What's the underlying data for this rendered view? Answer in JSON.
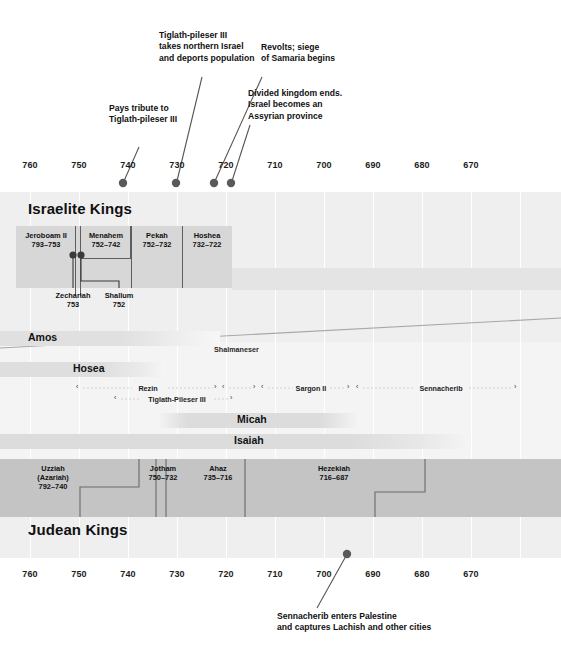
{
  "axis": {
    "ticks": [
      "760",
      "750",
      "740",
      "730",
      "720",
      "710",
      "700",
      "690",
      "680",
      "670"
    ],
    "tick_values": [
      760,
      750,
      740,
      730,
      720,
      710,
      700,
      690,
      680,
      670
    ],
    "direction": "BC descending left to right"
  },
  "sections": {
    "israelite_title": "Israelite Kings",
    "judean_title": "Judean Kings"
  },
  "annotations_top": [
    {
      "id": "pays-tribute",
      "lines": [
        "Pays tribute to",
        "Tiglath-pileser III"
      ],
      "marker_year": 743
    },
    {
      "id": "takes-northern-israel",
      "lines": [
        "Tiglath-pileser III",
        "takes northern Israel",
        "and deports population"
      ],
      "marker_year": 733
    },
    {
      "id": "revolts-siege",
      "lines": [
        "Revolts; siege",
        "of Samaria begins"
      ],
      "marker_year": 725
    },
    {
      "id": "divided-kingdom-ends",
      "lines": [
        "Divided kingdom ends.",
        "Israel becomes an",
        "Assyrian province"
      ],
      "marker_year": 722
    }
  ],
  "annotation_bottom": {
    "id": "sennacherib-palestine",
    "lines": [
      "Sennacherib enters Palestine",
      "and captures Lachish and other cities"
    ],
    "marker_year": 701
  },
  "israelite_kings": [
    {
      "name": "Jeroboam II",
      "years": "793–753",
      "start": 793,
      "end": 753
    },
    {
      "name": "Menahem",
      "years": "752–742",
      "start": 752,
      "end": 742
    },
    {
      "name": "Pekah",
      "years": "752–732",
      "start": 752,
      "end": 732
    },
    {
      "name": "Hoshea",
      "years": "732–722",
      "start": 732,
      "end": 722
    }
  ],
  "israelite_short_kings": [
    {
      "name": "Zechariah",
      "years": "753",
      "year": 753
    },
    {
      "name": "Shallum",
      "years": "752",
      "year": 752
    }
  ],
  "judean_kings": [
    {
      "name": "Uzziah",
      "alt": "(Azariah)",
      "years": "792–740",
      "start": 792,
      "end": 740
    },
    {
      "name": "Jotham",
      "alt": "",
      "years": "750–732",
      "start": 750,
      "end": 732
    },
    {
      "name": "Ahaz",
      "alt": "",
      "years": "735–716",
      "start": 735,
      "end": 716
    },
    {
      "name": "Hezekiah",
      "alt": "",
      "years": "716–687",
      "start": 716,
      "end": 687
    }
  ],
  "prophets": [
    {
      "name": "Amos",
      "row": 1
    },
    {
      "name": "Hosea",
      "row": 2
    },
    {
      "name": "Micah",
      "row": 3
    },
    {
      "name": "Isaiah",
      "row": 4
    }
  ],
  "assyrian_rulers": [
    {
      "name": "Shalmaneser",
      "row": 0
    },
    {
      "name": "Rezin",
      "row": 1
    },
    {
      "name": "Sargon II",
      "row": 1
    },
    {
      "name": "Sennacherib",
      "row": 1
    },
    {
      "name": "Tiglath-Pileser III",
      "row": 2
    }
  ],
  "colors": {
    "background": "#ffffff",
    "band": "#efefef",
    "gridline": "#ffffff",
    "israel_bar": "#d7d7d7",
    "israel_bar_tail": "#e4e4e4",
    "judah_bar": "#c4c4c4",
    "divider": "#5e5e5e",
    "marker_dot": "#5a5a5a",
    "leader_line": "#555555",
    "text": "#111111"
  }
}
